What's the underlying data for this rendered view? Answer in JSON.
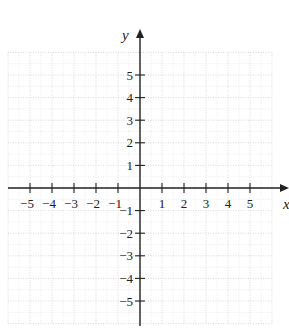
{
  "chart_data": {
    "type": "coordinate-plane",
    "xlabel": "x",
    "ylabel": "y",
    "xlim": [
      -6,
      6
    ],
    "ylim": [
      -6,
      6
    ],
    "grid": true,
    "x_ticks": [
      -5,
      -4,
      -3,
      -2,
      -1,
      1,
      2,
      3,
      4,
      5
    ],
    "y_ticks": [
      5,
      4,
      3,
      2,
      1,
      -1,
      -2,
      -3,
      -4,
      -5
    ],
    "x_tick_labels": [
      "−5",
      "−4",
      "−3",
      "−2",
      "−1",
      "1",
      "2",
      "3",
      "4",
      "5"
    ],
    "y_tick_labels": [
      "5",
      "4",
      "3",
      "2",
      "1",
      "−1",
      "−2",
      "−3",
      "−4",
      "−5"
    ]
  },
  "axes": {
    "x_label": "x",
    "y_label": "y"
  },
  "colors": {
    "axis": "#222222",
    "grid": "#d4d4d4"
  }
}
